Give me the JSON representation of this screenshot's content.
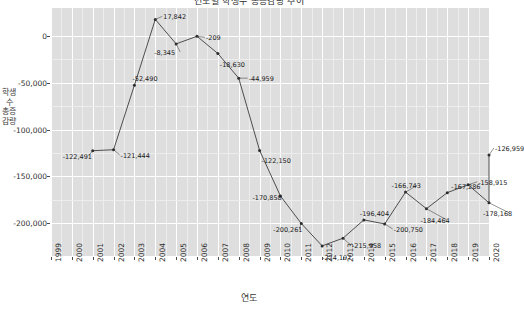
{
  "chart": {
    "title": "연도별 학생수 총증감량 추이",
    "xlabel": "연도",
    "ylabel": "학생수 총증감량",
    "panel_color": "#dedede",
    "grid_color": "#ffffff",
    "line_color": "#3d3d3d",
    "marker_color": "#2b2b2b"
  },
  "chart_data": {
    "type": "line",
    "title": "연도별 학생수 총증감량 추이",
    "xlabel": "연도",
    "ylabel": "학생수 총증감량",
    "ylim": [
      -235000,
      30000
    ],
    "yticks": [
      0,
      -50000,
      -100000,
      -150000,
      -200000
    ],
    "ytick_labels": [
      "0",
      "-50,000",
      "-100,000",
      "-150,000",
      "-200,000"
    ],
    "xticks": [
      "1999",
      "2000",
      "2001",
      "2002",
      "2003",
      "2004",
      "2005",
      "2006",
      "2007",
      "2008",
      "2009",
      "2010",
      "2011",
      "2012",
      "2013",
      "2014",
      "2015",
      "2016",
      "2017",
      "2018",
      "2019",
      "2020"
    ],
    "grid": true,
    "legend": null,
    "x": [
      2001,
      2002,
      2003,
      2004,
      2005,
      2006,
      2007,
      2008,
      2009,
      2010,
      2011,
      2012,
      2013,
      2014,
      2015,
      2016,
      2017,
      2018,
      2019,
      2020
    ],
    "values": [
      -122491,
      -121444,
      -52490,
      17842,
      -8345,
      -209,
      -18630,
      -44959,
      -122150,
      -170858,
      -200261,
      -224197,
      -215958,
      -196404,
      -200750,
      -166743,
      -184464,
      -167286,
      -158915,
      -178168
    ],
    "point_labels": [
      "-122,491",
      "-121,444",
      "-52,490",
      "17,842",
      "-8,345",
      "-209",
      "-18,630",
      "-44,959",
      "-122,150",
      "-170,858",
      "-200,261",
      "-224,197",
      "-215,958",
      "-196,404",
      "-200,750",
      "-166,743",
      "-184,464",
      "-167,286",
      "-158,915",
      "-178,168"
    ],
    "extra_point": {
      "x": 2020,
      "value": -126959,
      "label": "-126,959"
    }
  }
}
